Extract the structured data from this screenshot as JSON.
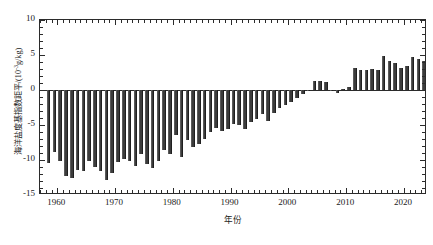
{
  "chart_data": {
    "type": "bar",
    "title": "",
    "xlabel": "年份",
    "ylabel": "海洋盐度基指数距平/(10⁻³g/kg)",
    "ylabel_main": "海洋盐度基指数距平/(10",
    "ylabel_sup": "-3",
    "ylabel_tail": "g/kg)",
    "xlim": [
      1957,
      2024
    ],
    "ylim": [
      -15,
      10
    ],
    "grid": false,
    "legend": null,
    "bar_color": "#3c3c3c",
    "axis_color": "#2b2b2b",
    "y_ticks": [
      10,
      5,
      0,
      -5,
      -10,
      -15
    ],
    "y_tick_labels": [
      "10",
      "5",
      "0",
      "-5",
      "-10",
      "-15"
    ],
    "y_minor_step": 1,
    "x_ticks": [
      1960,
      1970,
      1980,
      1990,
      2000,
      2010,
      2020
    ],
    "x_tick_labels": [
      "1960",
      "1970",
      "1980",
      "1990",
      "2000",
      "2010",
      "2020"
    ],
    "x_minor_step": 1,
    "categories": [
      1958,
      1959,
      1960,
      1961,
      1962,
      1963,
      1964,
      1965,
      1966,
      1967,
      1968,
      1969,
      1970,
      1971,
      1972,
      1973,
      1974,
      1975,
      1976,
      1977,
      1978,
      1979,
      1980,
      1981,
      1982,
      1983,
      1984,
      1985,
      1986,
      1987,
      1988,
      1989,
      1990,
      1991,
      1992,
      1993,
      1994,
      1995,
      1996,
      1997,
      1998,
      1999,
      2000,
      2001,
      2002,
      2003,
      2004,
      2005,
      2006,
      2007,
      2008,
      2009,
      2010,
      2011,
      2012,
      2013,
      2014,
      2015,
      2016,
      2017,
      2018,
      2019,
      2020,
      2021,
      2022,
      2023
    ],
    "values": [
      -10.4,
      -8.9,
      -10.2,
      -12.3,
      -12.6,
      -11.4,
      -11.6,
      -10.1,
      -11.0,
      -11.6,
      -12.9,
      -11.8,
      -10.3,
      -9.9,
      -10.2,
      -10.9,
      -9.1,
      -10.5,
      -11.2,
      -10.1,
      -8.6,
      -9.1,
      -6.4,
      -9.6,
      -7.1,
      -8.2,
      -7.7,
      -7.0,
      -6.0,
      -5.4,
      -5.9,
      -5.6,
      -4.9,
      -5.0,
      -5.6,
      -4.5,
      -4.2,
      -3.4,
      -4.4,
      -3.3,
      -2.6,
      -2.2,
      -1.7,
      -1.1,
      -0.5,
      -0.2,
      1.3,
      1.3,
      1.2,
      -0.2,
      -0.4,
      0.1,
      0.5,
      3.2,
      2.9,
      2.9,
      3.0,
      2.9,
      4.8,
      4.2,
      3.8,
      3.2,
      3.5,
      4.7,
      4.5,
      4.2
    ]
  }
}
